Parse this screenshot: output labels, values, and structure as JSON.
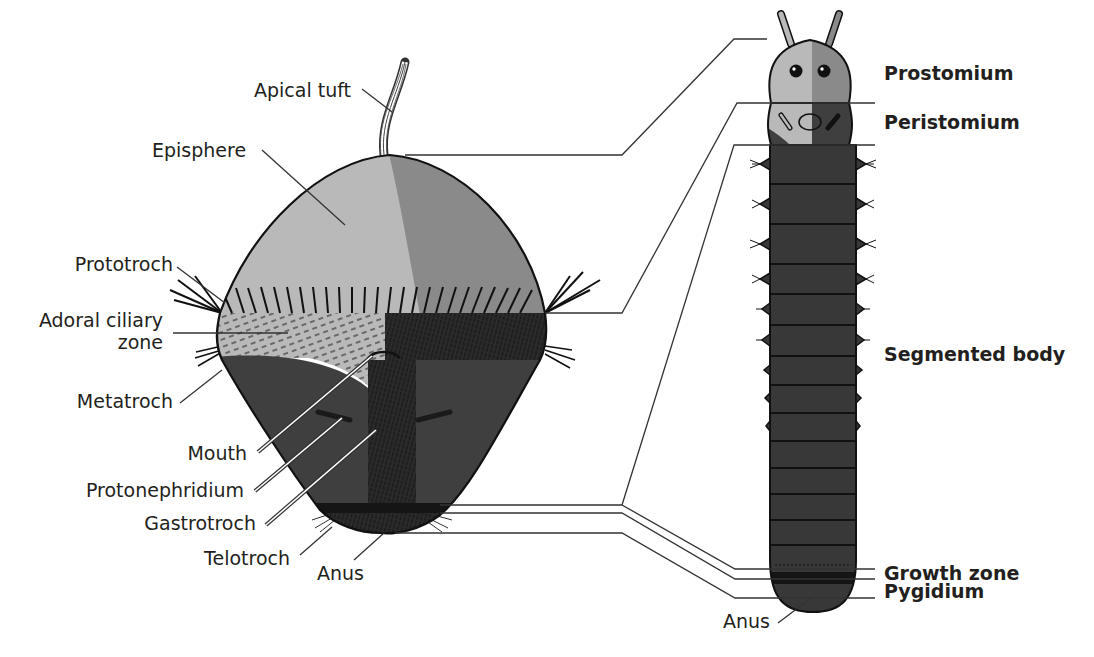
{
  "colors": {
    "light_grey": "#b9b9b9",
    "mid_grey": "#8a8a8a",
    "dark_grey": "#3f3f3f",
    "very_dark": "#1a1a1a",
    "outline": "#111111",
    "text": "#231f20"
  },
  "larva": {
    "labels": [
      {
        "id": "apical-tuft",
        "text": "Apical tuft"
      },
      {
        "id": "episphere",
        "text": "Episphere"
      },
      {
        "id": "prototroch",
        "text": "Prototroch"
      },
      {
        "id": "adoral-ciliary-zone-1",
        "text": "Adoral ciliary"
      },
      {
        "id": "adoral-ciliary-zone-2",
        "text": "zone"
      },
      {
        "id": "metatroch",
        "text": "Metatroch"
      },
      {
        "id": "mouth",
        "text": "Mouth"
      },
      {
        "id": "protonephridium",
        "text": "Protonephridium"
      },
      {
        "id": "gastrotroch",
        "text": "Gastrotroch"
      },
      {
        "id": "telotroch",
        "text": "Telotroch"
      },
      {
        "id": "anus",
        "text": "Anus"
      }
    ]
  },
  "worm": {
    "labels": [
      {
        "id": "prostomium",
        "text": "Prostomium"
      },
      {
        "id": "peristomium",
        "text": "Peristomium"
      },
      {
        "id": "segmented-body",
        "text": "Segmented body"
      },
      {
        "id": "growth-zone",
        "text": "Growth zone"
      },
      {
        "id": "pygidium",
        "text": "Pygidium"
      },
      {
        "id": "anus",
        "text": "Anus"
      }
    ]
  }
}
